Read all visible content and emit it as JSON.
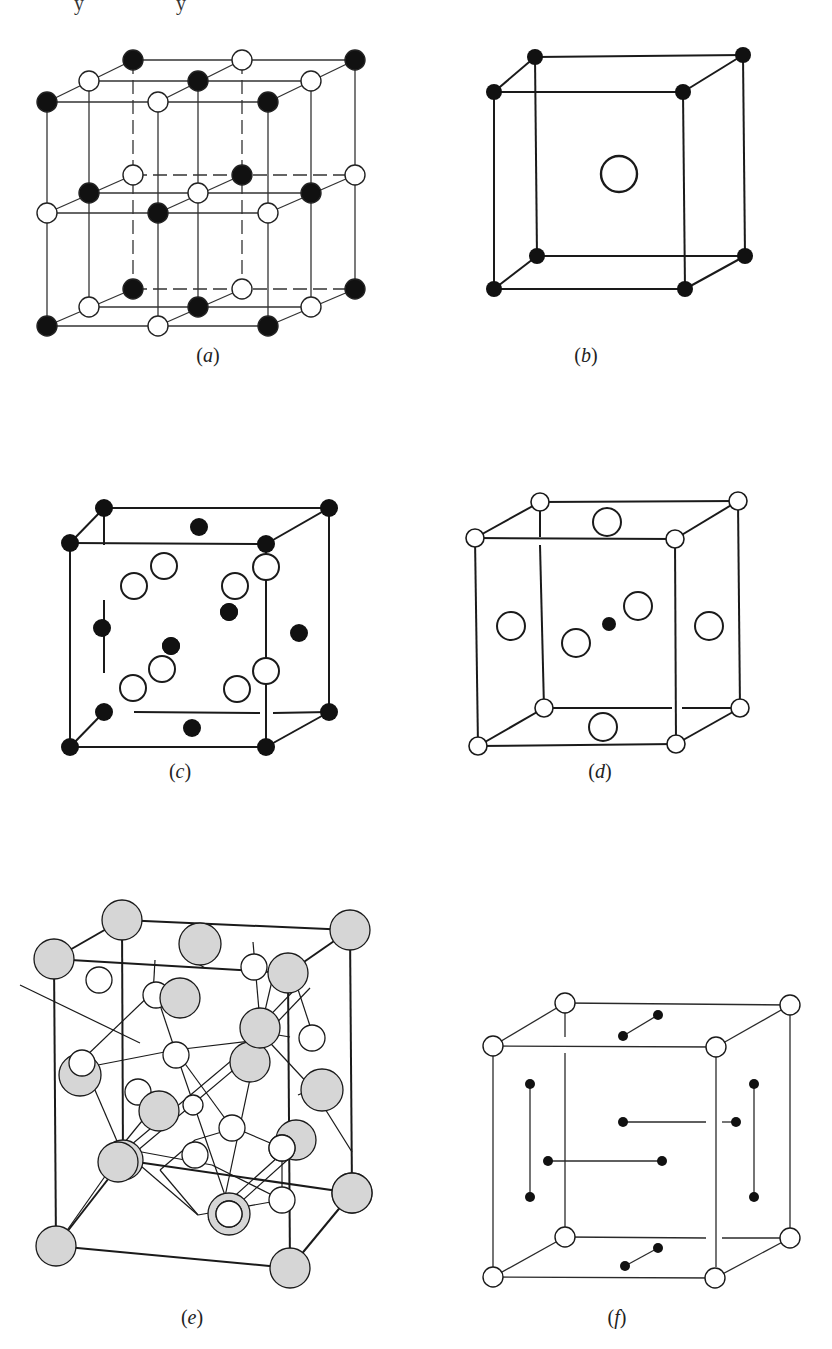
{
  "page": {
    "background": "#ffffff",
    "ink": "#1a1a1a",
    "shade": "#d6d6d6"
  },
  "top_cut_text": [
    "y",
    "y"
  ],
  "panels": [
    {
      "id": "a",
      "caption": "a",
      "description": "NaCl-type lattice: two-by-two stack of cubes with alternating filled and open atoms",
      "atom_types": [
        "filled-black",
        "open-white"
      ]
    },
    {
      "id": "b",
      "caption": "b",
      "description": "CsCl-type cell: filled atoms at cube corners, one large open atom at body center",
      "atom_types": [
        "filled-black",
        "open-white"
      ]
    },
    {
      "id": "c",
      "caption": "c",
      "description": "Zinc-blende/fluorite-type cell: filled atoms at corners and face centers, open atoms in interior",
      "atom_types": [
        "filled-black",
        "open-white"
      ]
    },
    {
      "id": "d",
      "caption": "d",
      "description": "Perovskite-type cell: open atoms at corners and face centers, small filled atom at body center",
      "atom_types": [
        "filled-black",
        "open-white"
      ]
    },
    {
      "id": "e",
      "caption": "e",
      "description": "Complex cubic cell with shaded large atoms and small open atoms connected by bonds",
      "atom_types": [
        "shaded-gray",
        "open-white"
      ]
    },
    {
      "id": "f",
      "caption": "f",
      "description": "Cubic cell with open corner atoms and filled dumbbell pairs on each face",
      "atom_types": [
        "filled-black",
        "open-white"
      ]
    }
  ]
}
